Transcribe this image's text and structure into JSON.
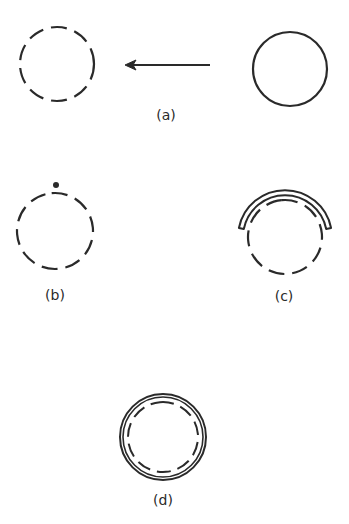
{
  "figure": {
    "stroke_color": "#2a2a2a",
    "panels": [
      {
        "id": "a",
        "label": "(a)",
        "description": "Solid circle on the right moves left (arrow) becoming a dashed circle"
      },
      {
        "id": "b",
        "label": "(b)",
        "description": "Dashed circle with a dot above it"
      },
      {
        "id": "c",
        "label": "(c)",
        "description": "Dashed circle partially covered by a double-line arc over its top"
      },
      {
        "id": "d",
        "label": "(d)",
        "description": "Dashed circle fully enclosed by a solid double-line circle"
      }
    ]
  }
}
